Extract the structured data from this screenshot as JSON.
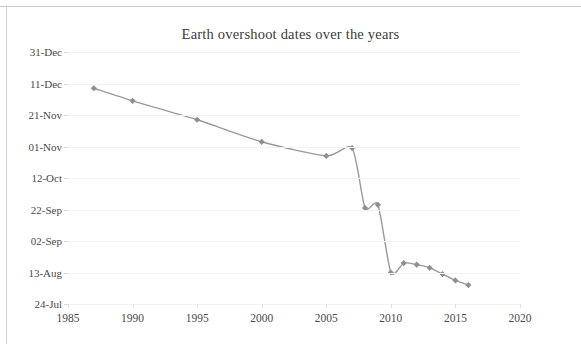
{
  "chart_data": {
    "type": "line",
    "title": "Earth overshoot dates over the years",
    "xlabel": "",
    "ylabel": "",
    "grid": true,
    "legend": false,
    "line_color": "#9a9a9a",
    "marker_color": "#8f8f8f",
    "marker_shape": "diamond",
    "xlim": [
      1985,
      2020
    ],
    "xticks": [
      1985,
      1990,
      1995,
      2000,
      2005,
      2010,
      2015,
      2020
    ],
    "xtick_labels": [
      "1985",
      "1990",
      "1995",
      "2000",
      "2005",
      "2010",
      "2015",
      "2020"
    ],
    "ylim_labels": [
      "31-Dec",
      "11-Dec",
      "21-Nov",
      "01-Nov",
      "12-Oct",
      "22-Sep",
      "02-Sep",
      "13-Aug",
      "24-Jul"
    ],
    "ytick_labels": [
      "31-Dec",
      "11-Dec",
      "21-Nov",
      "01-Nov",
      "12-Oct",
      "22-Sep",
      "02-Sep",
      "13-Aug",
      "24-Jul"
    ],
    "ytick_day_of_year": [
      365,
      345,
      325,
      305,
      285,
      265,
      245,
      225,
      205
    ],
    "x": [
      1987,
      1990,
      1995,
      2000,
      2005,
      2007,
      2008,
      2009,
      2010,
      2011,
      2012,
      2013,
      2014,
      2015,
      2016
    ],
    "y_labels": [
      "08-Dec",
      "30-Nov",
      "18-Nov",
      "04-Nov",
      "26-Oct",
      "31-Oct",
      "23-Sep",
      "25-Sep",
      "13-Aug",
      "19-Aug",
      "17-Aug",
      "16-Aug",
      "12-Aug",
      "08-Aug",
      "04-Aug"
    ],
    "y_day_of_year": [
      342,
      334,
      322,
      308,
      299,
      304,
      266,
      268,
      225,
      231,
      230,
      228,
      224,
      220,
      217
    ],
    "values": [
      342,
      334,
      322,
      308,
      299,
      304,
      266,
      268,
      225,
      231,
      230,
      228,
      224,
      220,
      217
    ],
    "categories": [
      "1987",
      "1990",
      "1995",
      "2000",
      "2005",
      "2007",
      "2008",
      "2009",
      "2010",
      "2011",
      "2012",
      "2013",
      "2014",
      "2015",
      "2016"
    ]
  },
  "chart": {
    "title": "Earth overshoot dates over the years"
  }
}
